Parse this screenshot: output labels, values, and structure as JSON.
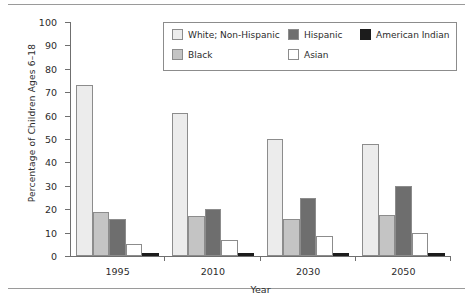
{
  "chart_data": {
    "type": "bar",
    "title": "",
    "subtitle": "",
    "xlabel": "Year",
    "ylabel": "Percentage of Children Ages 6–18",
    "categories": [
      "1995",
      "2010",
      "2030",
      "2050"
    ],
    "ylim": [
      0,
      100
    ],
    "yticks": [
      0,
      10,
      20,
      30,
      40,
      50,
      60,
      70,
      80,
      90,
      100
    ],
    "ytick_labels": [
      "0",
      "10",
      "20",
      "30",
      "40",
      "50",
      "60",
      "70",
      "80",
      "90",
      "100"
    ],
    "grid": false,
    "legend_position": "top-right-inside",
    "series": [
      {
        "name": "White; Non-Hispanic",
        "color": "#ececec",
        "values": [
          73,
          61,
          50,
          48
        ]
      },
      {
        "name": "Black",
        "color": "#c4c4c4",
        "values": [
          19,
          17,
          16,
          17.5
        ]
      },
      {
        "name": "Hispanic",
        "color": "#6e6e6e",
        "values": [
          16,
          20,
          25,
          30
        ]
      },
      {
        "name": "Asian",
        "color": "#ffffff",
        "values": [
          5,
          7,
          8.5,
          10
        ]
      },
      {
        "name": "American Indian",
        "color": "#1c1c1c",
        "values": [
          1.5,
          1.5,
          1.5,
          1.5
        ]
      }
    ]
  },
  "legend": {
    "entries": [
      {
        "label": "White; Non-Hispanic"
      },
      {
        "label": "Black"
      },
      {
        "label": "Hispanic"
      },
      {
        "label": "Asian"
      },
      {
        "label": "American Indian"
      }
    ]
  }
}
